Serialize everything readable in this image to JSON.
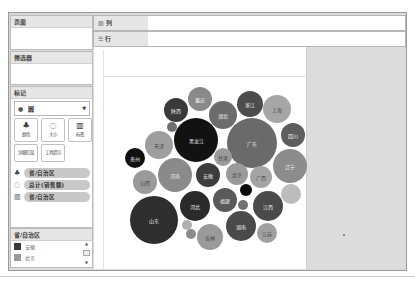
{
  "sidebar": {
    "pages_title": "页面",
    "filters_title": "筛选器",
    "marks_title": "标记",
    "mark_type": {
      "icon": "circle-icon",
      "label": "圆"
    },
    "mark_buttons": [
      {
        "id": "color",
        "label": "颜色",
        "icon": "color-icon"
      },
      {
        "id": "size",
        "label": "大小",
        "icon": "size-icon"
      },
      {
        "id": "label",
        "label": "标签",
        "icon": "label-icon"
      },
      {
        "id": "detail",
        "label": "详细信息",
        "icon": "detail-icon"
      },
      {
        "id": "tooltip",
        "label": "工具提示",
        "icon": "tooltip-icon"
      }
    ],
    "mark_pills": [
      {
        "icon": "color-icon",
        "label": "省/自治区"
      },
      {
        "icon": "size-icon",
        "label": "总计(销售额)"
      },
      {
        "icon": "label-icon",
        "label": "省/自治区"
      }
    ],
    "legend": {
      "title": "省/自治区",
      "items": [
        {
          "label": "安徽",
          "color": "#3a3a3a"
        },
        {
          "label": "北京",
          "color": "#9a9a9a"
        }
      ]
    }
  },
  "shelves": {
    "columns": {
      "icon": "columns-icon",
      "label": "列"
    },
    "rows": {
      "icon": "rows-icon",
      "label": "行"
    }
  },
  "chart_data": {
    "type": "packed-bubble",
    "title": "",
    "size_measure": "总计(销售额)",
    "color_dimension": "省/自治区",
    "label_dimension": "省/自治区",
    "bubbles": [
      {
        "label": "广东",
        "x": 252,
        "y": 143,
        "r": 25,
        "color": "#6a6a6a"
      },
      {
        "label": "黑龙江",
        "x": 196,
        "y": 140,
        "r": 22,
        "color": "#121212"
      },
      {
        "label": "山东",
        "x": 154,
        "y": 220,
        "r": 24,
        "color": "#2e2e2e"
      },
      {
        "label": "河南",
        "x": 175,
        "y": 175,
        "r": 17,
        "color": "#8a8a8a"
      },
      {
        "label": "湖南",
        "x": 241,
        "y": 226,
        "r": 15,
        "color": "#4a4a4a"
      },
      {
        "label": "河北",
        "x": 195,
        "y": 206,
        "r": 15,
        "color": "#2a2a2a"
      },
      {
        "label": "辽宁",
        "x": 290,
        "y": 166,
        "r": 17,
        "color": "#8c8c8c"
      },
      {
        "label": "江西",
        "x": 268,
        "y": 206,
        "r": 15,
        "color": "#4a4a4a"
      },
      {
        "label": "吉林",
        "x": 210,
        "y": 237,
        "r": 13,
        "color": "#9a9a9a"
      },
      {
        "label": "湖北",
        "x": 223,
        "y": 115,
        "r": 14,
        "color": "#6c6c6c"
      },
      {
        "label": "安徽",
        "x": 208,
        "y": 175,
        "r": 12,
        "color": "#3c3c3c"
      },
      {
        "label": "天津",
        "x": 159,
        "y": 145,
        "r": 14,
        "color": "#9e9e9e"
      },
      {
        "label": "上海",
        "x": 277,
        "y": 109,
        "r": 14,
        "color": "#a6a6a6"
      },
      {
        "label": "浙江",
        "x": 250,
        "y": 104,
        "r": 13,
        "color": "#4c4c4c"
      },
      {
        "label": "四川",
        "x": 293,
        "y": 135,
        "r": 12,
        "color": "#5e5e5e"
      },
      {
        "label": "福建",
        "x": 225,
        "y": 200,
        "r": 12,
        "color": "#5a5a5a"
      },
      {
        "label": "山西",
        "x": 145,
        "y": 182,
        "r": 12,
        "color": "#9a9a9a"
      },
      {
        "label": "陕西",
        "x": 176,
        "y": 110,
        "r": 12,
        "color": "#3a3a3a"
      },
      {
        "label": "重庆",
        "x": 200,
        "y": 99,
        "r": 12,
        "color": "#8a8a8a"
      },
      {
        "label": "北京",
        "x": 237,
        "y": 174,
        "r": 11,
        "color": "#9a9a9a"
      },
      {
        "label": "广西",
        "x": 261,
        "y": 177,
        "r": 11,
        "color": "#a4a4a4"
      },
      {
        "label": "江苏",
        "x": 267,
        "y": 233,
        "r": 10,
        "color": "#a0a0a0"
      },
      {
        "label": "贵州",
        "x": 135,
        "y": 158,
        "r": 10,
        "color": "#101010"
      },
      {
        "label": "甘肃",
        "x": 223,
        "y": 157,
        "r": 9,
        "color": "#9a9a9a"
      },
      {
        "label": "",
        "x": 291,
        "y": 194,
        "r": 10,
        "color": "#bcbcbc"
      },
      {
        "label": "",
        "x": 246,
        "y": 190,
        "r": 6,
        "color": "#0c0c0c"
      },
      {
        "label": "",
        "x": 243,
        "y": 205,
        "r": 5,
        "color": "#707070"
      },
      {
        "label": "",
        "x": 172,
        "y": 127,
        "r": 5,
        "color": "#707070"
      },
      {
        "label": "",
        "x": 187,
        "y": 225,
        "r": 5,
        "color": "#b0b0b0"
      },
      {
        "label": "",
        "x": 191,
        "y": 234,
        "r": 5,
        "color": "#8c8c8c"
      }
    ]
  }
}
